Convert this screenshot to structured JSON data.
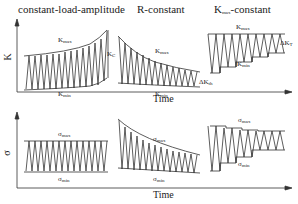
{
  "titles": {
    "left": "constant-load-amplitude",
    "middle": "R-constant",
    "right_base": "K",
    "right_sub": "max",
    "right_suffix": "-constant"
  },
  "top_panel": {
    "ylabel": "K",
    "xlabel": "Time",
    "labels": {
      "kmax_base": "K",
      "kmax_sub": "max",
      "kmin_base": "K",
      "kmin_sub": "min",
      "kc_base": "K",
      "kc_sub": "C",
      "dkth_base": "ΔK",
      "dkth_sub": "th",
      "dkt_base": "ΔK",
      "dkt_sub": "T"
    }
  },
  "bottom_panel": {
    "ylabel": "σ",
    "xlabel": "Time",
    "labels": {
      "smax_base": "σ",
      "smax_sub": "max",
      "smin_base": "σ",
      "smin_sub": "min"
    }
  }
}
